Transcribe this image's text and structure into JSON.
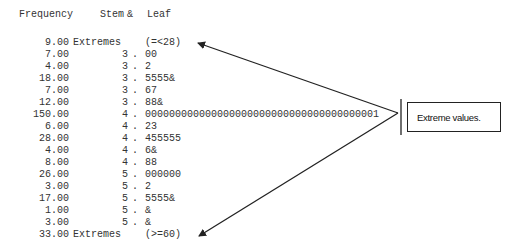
{
  "header": {
    "frequency": "Frequency",
    "stem": "Stem",
    "amp": "&",
    "leaf": "Leaf"
  },
  "rows": [
    {
      "freq": "9.00",
      "stem": "Extremes",
      "dot": "",
      "leaf": "(=<28)"
    },
    {
      "freq": "7.00",
      "stem": "3",
      "dot": ".",
      "leaf": "00"
    },
    {
      "freq": "4.00",
      "stem": "3",
      "dot": ".",
      "leaf": "2"
    },
    {
      "freq": "18.00",
      "stem": "3",
      "dot": ".",
      "leaf": "5555&"
    },
    {
      "freq": "7.00",
      "stem": "3",
      "dot": ".",
      "leaf": "67"
    },
    {
      "freq": "12.00",
      "stem": "3",
      "dot": ".",
      "leaf": "88&"
    },
    {
      "freq": "150.00",
      "stem": "4",
      "dot": ".",
      "leaf": "000000000000000000000000000000000000001"
    },
    {
      "freq": "6.00",
      "stem": "4",
      "dot": ".",
      "leaf": "23"
    },
    {
      "freq": "28.00",
      "stem": "4",
      "dot": ".",
      "leaf": "455555"
    },
    {
      "freq": "4.00",
      "stem": "4",
      "dot": ".",
      "leaf": "6&"
    },
    {
      "freq": "8.00",
      "stem": "4",
      "dot": ".",
      "leaf": "88"
    },
    {
      "freq": "26.00",
      "stem": "5",
      "dot": ".",
      "leaf": "000000"
    },
    {
      "freq": "3.00",
      "stem": "5",
      "dot": ".",
      "leaf": "2"
    },
    {
      "freq": "17.00",
      "stem": "5",
      "dot": ".",
      "leaf": "5555&"
    },
    {
      "freq": "1.00",
      "stem": "5",
      "dot": ".",
      "leaf": "&"
    },
    {
      "freq": "3.00",
      "stem": "5",
      "dot": ".",
      "leaf": "&"
    },
    {
      "freq": "33.00",
      "stem": "Extremes",
      "dot": "",
      "leaf": "(>=60)"
    }
  ],
  "callout": {
    "label": "Extreme values."
  },
  "colors": {
    "text": "#333333",
    "arrow": "#222222"
  }
}
